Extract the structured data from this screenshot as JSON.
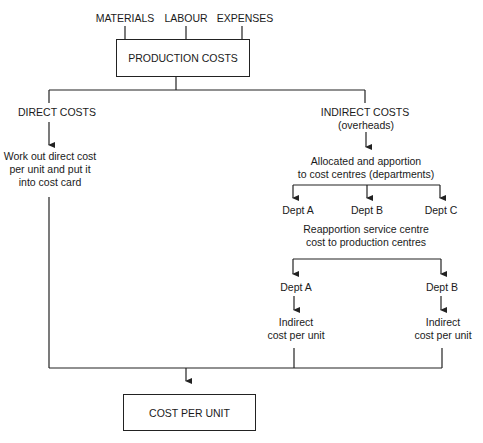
{
  "diagram": {
    "type": "flowchart",
    "line_color": "#222222",
    "inputs": [
      {
        "label": "MATERIALS"
      },
      {
        "label": "LABOUR"
      },
      {
        "label": "EXPENSES"
      }
    ],
    "production_box": {
      "label": "PRODUCTION COSTS"
    },
    "direct": {
      "title": "DIRECT COSTS",
      "step_lines": [
        "Work out direct cost",
        "per unit and put it",
        "into cost card"
      ]
    },
    "indirect": {
      "title": "INDIRECT COSTS",
      "subtitle": "(overheads)",
      "allocate_lines": [
        "Allocated and apportion",
        "to cost centres (departments)"
      ],
      "departments": [
        "Dept A",
        "Dept B",
        "Dept C"
      ],
      "reapportion_lines": [
        "Reapportion service centre",
        "cost to production centres"
      ],
      "production_departments": [
        {
          "label": "Dept A",
          "result_lines": [
            "Indirect",
            "cost per unit"
          ]
        },
        {
          "label": "Dept B",
          "result_lines": [
            "Indirect",
            "cost per unit"
          ]
        }
      ]
    },
    "result_box": {
      "label": "COST PER UNIT"
    }
  }
}
